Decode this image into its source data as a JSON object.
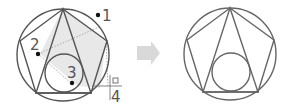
{
  "diagram": {
    "left_panel": {
      "step_labels": [
        "1",
        "2",
        "3",
        "4"
      ],
      "colors": {
        "stroke": "#555555",
        "shade": "#e6e6e6",
        "dot": "#111111",
        "guide": "#888888"
      }
    },
    "arrow": {
      "color": "#d9d9d9",
      "direction": "right"
    },
    "right_panel": {
      "colors": {
        "stroke": "#666666"
      }
    }
  }
}
